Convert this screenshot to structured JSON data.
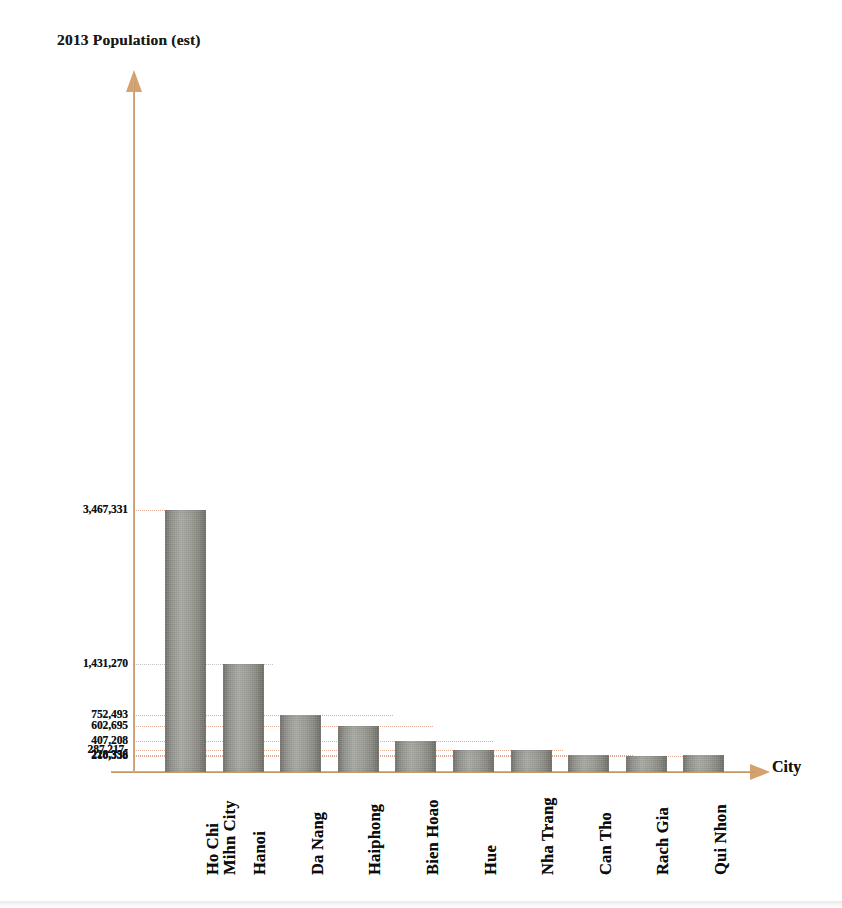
{
  "chart_data": {
    "type": "bar",
    "title": "",
    "ylabel": "2013 Population (est)",
    "xlabel": "City",
    "grid": true,
    "legend": null,
    "ylim": [
      0,
      3467331
    ],
    "categories": [
      "Ho Chi\nMihn City",
      "Hanoi",
      "Da Nang",
      "Haiphong",
      "Bien Hoao",
      "Hue",
      "Nha Trang",
      "Can Tho",
      "Rach Gia",
      "Qui Nhon"
    ],
    "values": [
      3467331,
      1431270,
      752493,
      602695,
      407208,
      287217,
      228356,
      210338,
      210338,
      210338
    ],
    "tick_labels": [
      "3,467,331",
      "1,431,270",
      "752,493",
      "602,695",
      "407,208",
      "287,217-",
      "228,356",
      "210,338"
    ],
    "tick_values": [
      3467331,
      1431270,
      752493,
      602695,
      407208,
      287217,
      228356,
      210338
    ],
    "bar_color": "#9b9b95",
    "axis_color": "#c8965f",
    "gridline_color": "#d98f72"
  },
  "axes": {
    "y_title": "2013 Population (est)",
    "x_title": "City"
  },
  "ticks": [
    {
      "label": "3,467,331",
      "value": 3467331
    },
    {
      "label": "1,431,270",
      "value": 1431270
    },
    {
      "label": "752,493",
      "value": 752493
    },
    {
      "label": "602,695",
      "value": 602695
    },
    {
      "label": "407,208",
      "value": 407208
    },
    {
      "label": "287,217-",
      "value": 287217
    },
    {
      "label": "228,356",
      "value": 228356
    },
    {
      "label": "210,338",
      "value": 210338
    }
  ],
  "bars": [
    {
      "label": "Ho Chi\nMihn City",
      "value": 3467331
    },
    {
      "label": "Hanoi",
      "value": 1431270
    },
    {
      "label": "Da Nang",
      "value": 752493
    },
    {
      "label": "Haiphong",
      "value": 602695
    },
    {
      "label": "Bien Hoao",
      "value": 407208
    },
    {
      "label": "Hue",
      "value": 287217
    },
    {
      "label": "Nha Trang",
      "value": 287217
    },
    {
      "label": "Can Tho",
      "value": 228356
    },
    {
      "label": "Rach Gia",
      "value": 210338
    },
    {
      "label": "Qui Nhon",
      "value": 228356
    }
  ]
}
